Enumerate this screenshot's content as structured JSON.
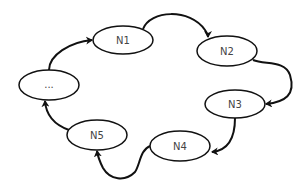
{
  "diagram": {
    "type": "cycle",
    "nodes": [
      {
        "id": "dots",
        "label": "...",
        "cx": 49,
        "cy": 85,
        "rx": 30,
        "ry": 15
      },
      {
        "id": "n1",
        "label": "N1",
        "cx": 123,
        "cy": 40,
        "rx": 30,
        "ry": 14
      },
      {
        "id": "n2",
        "label": "N2",
        "cx": 227,
        "cy": 51,
        "rx": 30,
        "ry": 15
      },
      {
        "id": "n3",
        "label": "N3",
        "cx": 235,
        "cy": 104,
        "rx": 30,
        "ry": 14
      },
      {
        "id": "n4",
        "label": "N4",
        "cx": 180,
        "cy": 146,
        "rx": 30,
        "ry": 15
      },
      {
        "id": "n5",
        "label": "N5",
        "cx": 97,
        "cy": 135,
        "rx": 30,
        "ry": 15
      }
    ],
    "edges": [
      {
        "from": "dots",
        "to": "N1"
      },
      {
        "from": "N1",
        "to": "N2"
      },
      {
        "from": "N2",
        "to": "N3"
      },
      {
        "from": "N3",
        "to": "N4"
      },
      {
        "from": "N4",
        "to": "N5"
      },
      {
        "from": "N5",
        "to": "dots"
      }
    ],
    "colors": {
      "stroke": "#111111",
      "background": "#ffffff",
      "text": "#444444"
    }
  }
}
